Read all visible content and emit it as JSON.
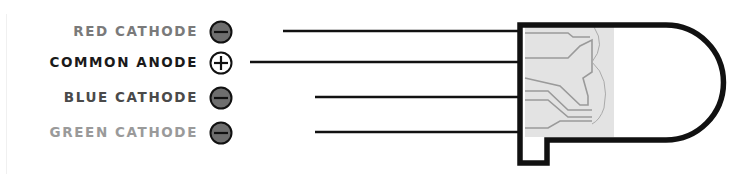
{
  "diagram": {
    "pins": [
      {
        "label": "RED CATHODE",
        "polarity": "minus-icon",
        "color": "#7a7a7a",
        "symbol_fill": "#6e6e6e",
        "line_y": 31,
        "line_x_start": 283
      },
      {
        "label": "COMMON ANODE",
        "polarity": "plus-icon",
        "color": "#1a1a1a",
        "symbol_fill": "#ffffff",
        "line_y": 62,
        "line_x_start": 250
      },
      {
        "label": "BLUE CATHODE",
        "polarity": "minus-icon",
        "color": "#4a4a4a",
        "symbol_fill": "#6e6e6e",
        "line_y": 97,
        "line_x_start": 315
      },
      {
        "label": "GREEN CATHODE",
        "polarity": "minus-icon",
        "color": "#9a9a9a",
        "symbol_fill": "#6e6e6e",
        "line_y": 132,
        "line_x_start": 315
      }
    ],
    "led_body": {
      "outline_color": "#111111",
      "lead_frame_fill": "#e3e3e3",
      "lead_frame_stroke": "#9a9a9a"
    }
  }
}
